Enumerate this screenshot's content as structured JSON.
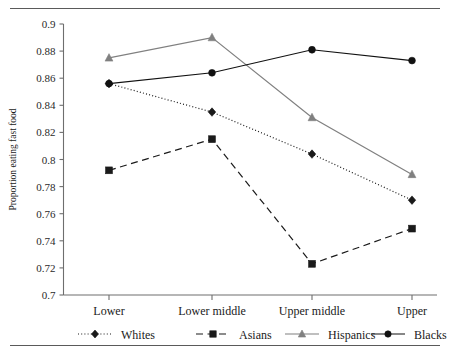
{
  "chart_data": {
    "type": "line",
    "title": "",
    "xlabel": "",
    "ylabel": "Proportion eating fast food",
    "categories": [
      "Lower",
      "Lower middle",
      "Upper middle",
      "Upper"
    ],
    "ylim": [
      0.7,
      0.9
    ],
    "yticks": [
      "0.7",
      "0.72",
      "0.74",
      "0.76",
      "0.78",
      "0.8",
      "0.82",
      "0.84",
      "0.86",
      "0.88",
      "0.9"
    ],
    "grid": false,
    "legend_position": "bottom",
    "series": [
      {
        "name": "Whites",
        "values": [
          0.856,
          0.835,
          0.804,
          0.77
        ],
        "color": "#1a1a1a",
        "line_style": "dotted",
        "marker": "diamond"
      },
      {
        "name": "Asians",
        "values": [
          0.792,
          0.815,
          0.723,
          0.749
        ],
        "color": "#1a1a1a",
        "line_style": "dashed",
        "marker": "square"
      },
      {
        "name": "Hispanics",
        "values": [
          0.875,
          0.89,
          0.831,
          0.789
        ],
        "color": "#808080",
        "line_style": "solid",
        "marker": "triangle"
      },
      {
        "name": "Blacks",
        "values": [
          0.856,
          0.864,
          0.881,
          0.873
        ],
        "color": "#111111",
        "line_style": "solid",
        "marker": "circle"
      }
    ]
  },
  "axis": {
    "y_title": "Proportion eating fast food"
  },
  "legend": {
    "items": [
      {
        "label": "Whites"
      },
      {
        "label": "Asians"
      },
      {
        "label": "Hispanics"
      },
      {
        "label": "Blacks"
      }
    ]
  }
}
